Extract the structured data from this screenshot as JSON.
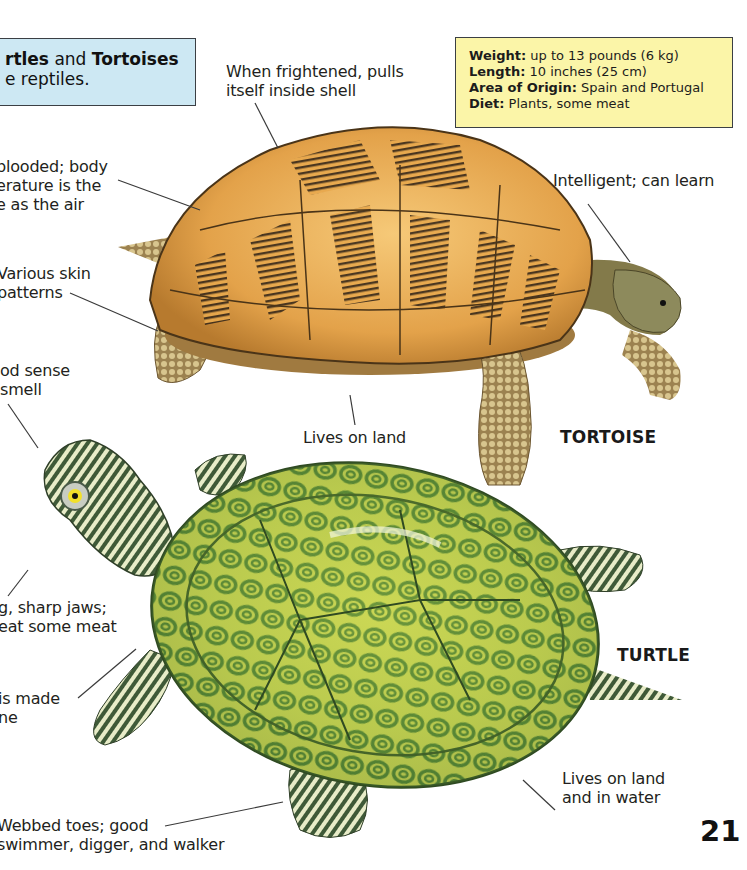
{
  "intro": {
    "bold1": "rtles",
    "mid": " and ",
    "bold2": "Tortoises",
    "line2": "e reptiles."
  },
  "facts": {
    "rows": [
      {
        "label": "Weight:",
        "value": "  up to 13 pounds (6 kg)"
      },
      {
        "label": "Length:",
        "value": "  10 inches (25 cm)"
      },
      {
        "label": "Area of Origin:",
        "value": "  Spain and Portugal"
      },
      {
        "label": "Diet:",
        "value": "  Plants, some meat"
      }
    ]
  },
  "callouts": {
    "frightened": [
      "When frightened, pulls",
      "itself inside shell"
    ],
    "cold_blooded": [
      " blooded; body",
      "erature is the",
      "e as the air"
    ],
    "skin": [
      "Various skin",
      "patterns"
    ],
    "smell": [
      "od sense",
      "smell"
    ],
    "intelligent": [
      "Intelligent; can learn"
    ],
    "lives_land": [
      "Lives on land"
    ],
    "jaws": [
      "g, sharp jaws;",
      "eat some meat"
    ],
    "shell_bone": [
      " is made",
      "ne"
    ],
    "land_water": [
      "Lives on land",
      "and in water"
    ],
    "webbed": [
      "Webbed toes; good",
      "swimmer, digger, and walker"
    ]
  },
  "species": {
    "tortoise": "TORTOISE",
    "turtle": "TURTLE"
  },
  "page_number": "21",
  "colors": {
    "intro_box_bg": "#cde8f3",
    "fact_box_bg": "#fbf5a8",
    "tortoise_shell": "#e8a94e",
    "tortoise_dark": "#3a2a1a",
    "turtle_shell": "#5f8f3a",
    "turtle_yellow": "#e6e85a"
  }
}
